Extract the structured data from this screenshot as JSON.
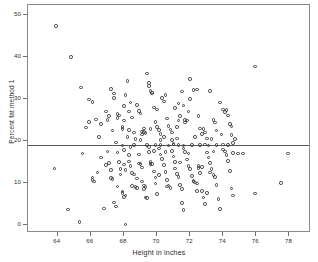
{
  "chart_data": {
    "type": "scatter",
    "title": "",
    "xlabel": "Height in inches",
    "ylabel": "Percent fat method 1",
    "xlim": [
      62.2,
      79.3
    ],
    "ylim": [
      -2.0,
      52.5
    ],
    "xticks": [
      64,
      66,
      68,
      70,
      72,
      74,
      76,
      78
    ],
    "yticks": [
      0,
      10,
      20,
      30,
      40,
      50
    ],
    "xticklabels": [
      "64",
      "66",
      "68",
      "70",
      "72",
      "74",
      "76",
      "78"
    ],
    "yticklabels": [
      "0",
      "10",
      "20",
      "30",
      "40",
      "50"
    ],
    "grid": false,
    "legend": null,
    "marker": "open-circle",
    "marker_color": "#3a3a3a",
    "frame_color": "#8a8a8a",
    "background": "#ffffff",
    "reference_lines": [
      {
        "orientation": "horizontal",
        "value": 19.0,
        "color": "#555555",
        "label": ""
      }
    ],
    "points": [
      [
        63.9,
        47.5
      ],
      [
        64.8,
        40.1
      ],
      [
        65.4,
        32.8
      ],
      [
        65.9,
        29.9
      ],
      [
        66.1,
        29.3
      ],
      [
        65.9,
        24.5
      ],
      [
        65.7,
        23.2
      ],
      [
        66.3,
        25.1
      ],
      [
        66.5,
        21.0
      ],
      [
        67.2,
        32.4
      ],
      [
        67.0,
        25.0
      ],
      [
        67.4,
        30.2
      ],
      [
        67.4,
        31.3
      ],
      [
        67.6,
        26.5
      ],
      [
        67.7,
        26.1
      ],
      [
        67.6,
        25.5
      ],
      [
        67.9,
        23.3
      ],
      [
        67.9,
        22.9
      ],
      [
        68.0,
        28.3
      ],
      [
        68.0,
        24.9
      ],
      [
        68.2,
        34.3
      ],
      [
        68.1,
        31.0
      ],
      [
        68.4,
        29.2
      ],
      [
        68.3,
        27.0
      ],
      [
        68.5,
        25.6
      ],
      [
        68.6,
        22.0
      ],
      [
        68.9,
        27.2
      ],
      [
        68.8,
        28.6
      ],
      [
        69.0,
        26.6
      ],
      [
        69.1,
        22.3
      ],
      [
        69.1,
        21.5
      ],
      [
        69.2,
        22.1
      ],
      [
        69.3,
        21.9
      ],
      [
        69.4,
        36.1
      ],
      [
        69.5,
        33.8
      ],
      [
        69.5,
        33.1
      ],
      [
        69.6,
        32.0
      ],
      [
        69.7,
        31.6
      ],
      [
        69.7,
        31.4
      ],
      [
        69.8,
        28.0
      ],
      [
        69.9,
        24.6
      ],
      [
        70.0,
        23.3
      ],
      [
        70.1,
        22.6
      ],
      [
        70.2,
        21.7
      ],
      [
        70.3,
        30.2
      ],
      [
        70.4,
        29.4
      ],
      [
        70.5,
        31.0
      ],
      [
        70.6,
        25.4
      ],
      [
        70.7,
        23.6
      ],
      [
        70.8,
        22.7
      ],
      [
        70.9,
        20.3
      ],
      [
        71.0,
        19.3
      ],
      [
        71.2,
        23.4
      ],
      [
        71.3,
        24.9
      ],
      [
        71.4,
        26.0
      ],
      [
        71.5,
        31.8
      ],
      [
        71.3,
        29.0
      ],
      [
        71.6,
        28.5
      ],
      [
        71.7,
        25.0
      ],
      [
        71.7,
        24.4
      ],
      [
        71.8,
        24.9
      ],
      [
        71.9,
        27.0
      ],
      [
        72.0,
        34.8
      ],
      [
        72.0,
        30.1
      ],
      [
        72.2,
        32.2
      ],
      [
        72.4,
        32.3
      ],
      [
        72.5,
        25.9
      ],
      [
        72.6,
        23.0
      ],
      [
        72.7,
        21.6
      ],
      [
        72.9,
        22.0
      ],
      [
        73.0,
        20.6
      ],
      [
        73.2,
        32.0
      ],
      [
        73.4,
        25.0
      ],
      [
        73.6,
        22.5
      ],
      [
        73.8,
        29.2
      ],
      [
        74.0,
        27.5
      ],
      [
        74.1,
        26.9
      ],
      [
        74.2,
        27.4
      ],
      [
        74.3,
        26.1
      ],
      [
        74.4,
        24.1
      ],
      [
        74.5,
        23.5
      ],
      [
        74.6,
        19.5
      ],
      [
        75.9,
        37.8
      ],
      [
        63.8,
        13.4
      ],
      [
        64.6,
        3.6
      ],
      [
        65.3,
        0.6
      ],
      [
        65.5,
        17.0
      ],
      [
        66.1,
        11.3
      ],
      [
        66.1,
        10.7
      ],
      [
        66.2,
        10.3
      ],
      [
        66.6,
        16.0
      ],
      [
        66.8,
        3.9
      ],
      [
        67.0,
        17.5
      ],
      [
        67.1,
        14.7
      ],
      [
        67.2,
        13.1
      ],
      [
        67.2,
        11.2
      ],
      [
        67.3,
        10.9
      ],
      [
        67.4,
        5.3
      ],
      [
        67.5,
        4.3
      ],
      [
        67.6,
        17.2
      ],
      [
        67.7,
        15.0
      ],
      [
        67.8,
        13.3
      ],
      [
        67.8,
        12.0
      ],
      [
        67.9,
        7.9
      ],
      [
        67.9,
        7.5
      ],
      [
        68.0,
        17.8
      ],
      [
        68.0,
        14.4
      ],
      [
        68.1,
        13.0
      ],
      [
        68.1,
        7.0
      ],
      [
        68.0,
        6.6
      ],
      [
        68.1,
        0.0
      ],
      [
        68.3,
        16.6
      ],
      [
        68.3,
        15.1
      ],
      [
        68.4,
        14.0
      ],
      [
        68.5,
        12.4
      ],
      [
        68.6,
        12.0
      ],
      [
        68.7,
        9.0
      ],
      [
        68.8,
        8.7
      ],
      [
        68.9,
        16.8
      ],
      [
        68.9,
        14.6
      ],
      [
        69.0,
        14.5
      ],
      [
        69.1,
        13.7
      ],
      [
        69.1,
        10.3
      ],
      [
        69.2,
        9.4
      ],
      [
        69.2,
        8.5
      ],
      [
        69.3,
        6.5
      ],
      [
        69.4,
        6.3
      ],
      [
        69.5,
        18.6
      ],
      [
        69.5,
        17.3
      ],
      [
        69.6,
        15.0
      ],
      [
        69.6,
        14.5
      ],
      [
        69.7,
        14.5
      ],
      [
        69.8,
        12.7
      ],
      [
        69.9,
        11.3
      ],
      [
        69.9,
        9.8
      ],
      [
        70.0,
        7.3
      ],
      [
        70.1,
        18.2
      ],
      [
        70.2,
        16.8
      ],
      [
        70.3,
        15.7
      ],
      [
        70.4,
        14.2
      ],
      [
        70.5,
        12.6
      ],
      [
        70.6,
        10.7
      ],
      [
        70.7,
        9.4
      ],
      [
        70.8,
        8.8
      ],
      [
        70.9,
        17.6
      ],
      [
        71.0,
        16.3
      ],
      [
        71.1,
        15.0
      ],
      [
        71.1,
        13.4
      ],
      [
        71.2,
        12.1
      ],
      [
        71.3,
        11.4
      ],
      [
        71.4,
        9.5
      ],
      [
        71.5,
        8.5
      ],
      [
        71.5,
        5.2
      ],
      [
        71.6,
        3.5
      ],
      [
        71.6,
        18.2
      ],
      [
        71.7,
        17.3
      ],
      [
        71.8,
        15.6
      ],
      [
        71.9,
        14.0
      ],
      [
        72.0,
        13.3
      ],
      [
        72.1,
        11.6
      ],
      [
        72.2,
        10.5
      ],
      [
        72.2,
        10.3
      ],
      [
        72.3,
        10.1
      ],
      [
        72.4,
        9.8
      ],
      [
        72.5,
        14.0
      ],
      [
        72.5,
        13.5
      ],
      [
        72.6,
        12.3
      ],
      [
        72.7,
        8.1
      ],
      [
        72.8,
        6.5
      ],
      [
        72.9,
        5.0
      ],
      [
        73.0,
        17.2
      ],
      [
        73.1,
        16.0
      ],
      [
        73.2,
        14.8
      ],
      [
        73.3,
        13.3
      ],
      [
        73.4,
        11.8
      ],
      [
        73.5,
        11.4
      ],
      [
        73.6,
        9.5
      ],
      [
        73.7,
        6.1
      ],
      [
        73.8,
        3.8
      ],
      [
        74.0,
        18.0
      ],
      [
        74.1,
        17.5
      ],
      [
        74.2,
        16.6
      ],
      [
        74.3,
        15.2
      ],
      [
        74.4,
        12.8
      ],
      [
        74.5,
        8.6
      ],
      [
        74.6,
        7.0
      ],
      [
        74.9,
        17.0
      ],
      [
        75.2,
        17.0
      ],
      [
        75.9,
        7.4
      ],
      [
        77.5,
        10.0
      ],
      [
        77.9,
        17.0
      ],
      [
        69.4,
        19.0
      ],
      [
        70.2,
        19.1
      ],
      [
        71.0,
        19.2
      ],
      [
        71.6,
        18.9
      ],
      [
        72.1,
        19.0
      ],
      [
        72.6,
        19.1
      ],
      [
        73.1,
        18.9
      ],
      [
        73.6,
        19.0
      ],
      [
        74.0,
        19.2
      ],
      [
        68.6,
        19.1
      ],
      [
        67.9,
        18.9
      ],
      [
        69.9,
        19.0
      ],
      [
        70.7,
        18.9
      ],
      [
        72.9,
        19.2
      ],
      [
        74.3,
        19.0
      ],
      [
        71.3,
        19.1
      ],
      [
        68.2,
        21.0
      ],
      [
        68.7,
        20.4
      ],
      [
        69.0,
        20.2
      ],
      [
        70.2,
        20.3
      ],
      [
        71.2,
        20.6
      ],
      [
        73.3,
        20.4
      ],
      [
        66.6,
        24.0
      ],
      [
        67.1,
        26.0
      ],
      [
        68.3,
        22.6
      ],
      [
        69.2,
        23.0
      ],
      [
        70.4,
        20.9
      ],
      [
        72.3,
        21.0
      ],
      [
        73.9,
        21.5
      ],
      [
        74.5,
        21.4
      ],
      [
        67.3,
        22.5
      ],
      [
        69.6,
        22.9
      ],
      [
        70.9,
        22.0
      ],
      [
        72.8,
        22.8
      ],
      [
        66.9,
        27.0
      ],
      [
        70.0,
        27.5
      ],
      [
        71.1,
        27.9
      ],
      [
        73.5,
        24.4
      ],
      [
        74.7,
        20.5
      ],
      [
        67.5,
        19.6
      ],
      [
        68.4,
        18.5
      ],
      [
        69.8,
        17.6
      ],
      [
        70.5,
        17.4
      ],
      [
        71.9,
        17.0
      ],
      [
        73.4,
        17.5
      ],
      [
        74.6,
        17.1
      ],
      [
        66.4,
        12.5
      ],
      [
        67.6,
        9.1
      ],
      [
        68.5,
        9.3
      ],
      [
        69.3,
        9.0
      ],
      [
        70.6,
        9.1
      ],
      [
        72.4,
        8.0
      ],
      [
        73.0,
        7.5
      ],
      [
        66.9,
        14.2
      ],
      [
        68.8,
        11.0
      ],
      [
        70.1,
        11.8
      ],
      [
        71.4,
        14.9
      ],
      [
        72.7,
        13.8
      ],
      [
        73.2,
        12.5
      ]
    ]
  }
}
